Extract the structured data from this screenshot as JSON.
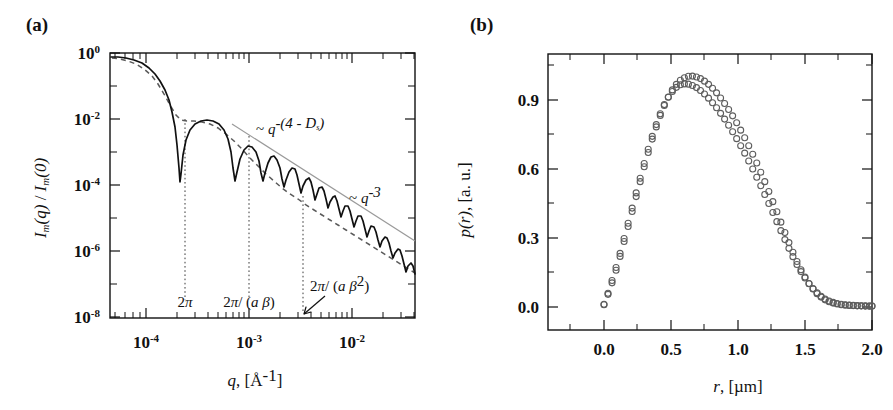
{
  "figure": {
    "panels": [
      {
        "id": "a",
        "label": "(a)",
        "xlabel_parts": {
          "sym": "q",
          "unit": ", [Å",
          "exp": "-1",
          "close": "]"
        },
        "ylabel": "Im(q) / Im(0)"
      },
      {
        "id": "b",
        "label": "(b)",
        "xlabel": "r, [µm]",
        "ylabel": "p(r), [a. u.]"
      }
    ]
  },
  "chart_data": [
    {
      "type": "line",
      "panel": "a",
      "title": "",
      "xlabel": "q, [Å^-1]",
      "ylabel": "I_m(q) / I_m(0)",
      "xscale": "log",
      "yscale": "log",
      "xlim": [
        5e-05,
        0.05
      ],
      "ylim": [
        1e-08,
        1.3
      ],
      "xticks": [
        0.0001,
        0.001,
        0.01
      ],
      "xticklabels": [
        "10",
        "10",
        "10"
      ],
      "xtick_exponents": [
        "-4",
        "-3",
        "-2"
      ],
      "yticks": [
        1.0,
        0.01,
        0.0001,
        1e-06,
        1e-08
      ],
      "yticklabels": [
        "10",
        "10",
        "10",
        "10",
        "10"
      ],
      "ytick_exponents": [
        "0",
        "-2",
        "-4",
        "-6",
        "-8"
      ],
      "grid": false,
      "legend": "none",
      "series": [
        {
          "name": "model scattering intensity (solid)",
          "style": "solid",
          "color": "#111111",
          "description": "oscillatory form factor with deep minima decaying as power law"
        },
        {
          "name": "envelope / smooth fit (dashed)",
          "style": "dashed",
          "color": "#5a5a5a",
          "description": "smoothed envelope following q^-(4-Ds)"
        },
        {
          "name": "q^-3 guide line (thin grey)",
          "style": "thin-solid",
          "color": "#9a9a9a",
          "description": "asymptotic power law guide"
        }
      ],
      "annotations": [
        {
          "text": "~ q",
          "sup": "-(4 - Ds)",
          "x": 0.0013,
          "y": 0.02,
          "name": "power-law-4-minus-ds"
        },
        {
          "text": "~ q",
          "sup": "-3",
          "x": 0.009,
          "y": 0.0006,
          "name": "power-law-minus-3"
        },
        {
          "text": "2π",
          "x": 0.00031,
          "y": 4e-08,
          "name": "marker-2pi"
        },
        {
          "text": "2π/ (a β)",
          "x": 0.001,
          "y": 4e-08,
          "name": "marker-2pi-over-a-beta"
        },
        {
          "text": "2π/ (a β",
          "sup": "2",
          "close": ")",
          "x": 0.003,
          "y": 2e-07,
          "name": "marker-2pi-over-a-beta-squared"
        }
      ],
      "vertical_markers": [
        {
          "x": 0.00031,
          "label": "2π"
        },
        {
          "x": 0.001,
          "label": "2π/ (a β)"
        },
        {
          "x": 0.003,
          "label": "2π/ (a β^2)"
        }
      ]
    },
    {
      "type": "scatter",
      "panel": "b",
      "title": "",
      "xlabel": "r, [µm]",
      "ylabel": "p(r), [a. u.]",
      "xscale": "linear",
      "yscale": "linear",
      "xlim": [
        -0.17,
        2.18
      ],
      "ylim": [
        -0.09,
        1.12
      ],
      "xticks": [
        0.0,
        0.5,
        1.0,
        1.5,
        2.0
      ],
      "xticklabels": [
        "0.0",
        "0.5",
        "1.0",
        "1.5",
        "2.0"
      ],
      "yticks": [
        0.0,
        0.3,
        0.6,
        0.9
      ],
      "yticklabels": [
        "0.0",
        "0.3",
        "0.6",
        "0.9"
      ],
      "grid": false,
      "legend": "none",
      "marker": "open-circle",
      "marker_color": "#5d5d5d",
      "series": [
        {
          "name": "p(r) distribution A",
          "x": [
            0.0,
            0.03,
            0.06,
            0.09,
            0.12,
            0.15,
            0.18,
            0.21,
            0.24,
            0.27,
            0.3,
            0.33,
            0.36,
            0.39,
            0.42,
            0.45,
            0.48,
            0.51,
            0.54,
            0.57,
            0.6,
            0.63,
            0.66,
            0.69,
            0.72,
            0.75,
            0.78,
            0.81,
            0.84,
            0.87,
            0.9,
            0.93,
            0.96,
            0.99,
            1.02,
            1.05,
            1.08,
            1.11,
            1.14,
            1.17,
            1.2,
            1.23,
            1.26,
            1.29,
            1.32,
            1.35,
            1.38,
            1.41,
            1.44,
            1.47,
            1.5,
            1.53,
            1.56,
            1.59,
            1.62,
            1.65,
            1.68,
            1.71,
            1.74,
            1.77,
            1.8,
            1.83,
            1.86,
            1.89,
            1.92,
            1.95,
            1.98,
            2.0
          ],
          "y": [
            0.01,
            0.055,
            0.105,
            0.16,
            0.22,
            0.285,
            0.35,
            0.415,
            0.48,
            0.545,
            0.61,
            0.672,
            0.73,
            0.783,
            0.833,
            0.876,
            0.913,
            0.944,
            0.968,
            0.986,
            0.997,
            1.003,
            1.004,
            1.0,
            0.993,
            0.982,
            0.968,
            0.951,
            0.931,
            0.909,
            0.885,
            0.859,
            0.831,
            0.801,
            0.769,
            0.736,
            0.701,
            0.664,
            0.626,
            0.586,
            0.545,
            0.502,
            0.458,
            0.414,
            0.369,
            0.324,
            0.28,
            0.238,
            0.198,
            0.162,
            0.13,
            0.102,
            0.078,
            0.058,
            0.043,
            0.031,
            0.023,
            0.017,
            0.013,
            0.01,
            0.008,
            0.007,
            0.006,
            0.005,
            0.005,
            0.004,
            0.004,
            0.004
          ]
        },
        {
          "name": "p(r) distribution B",
          "x": [
            0.0,
            0.03,
            0.06,
            0.09,
            0.12,
            0.15,
            0.18,
            0.21,
            0.24,
            0.27,
            0.3,
            0.33,
            0.36,
            0.39,
            0.42,
            0.45,
            0.48,
            0.51,
            0.54,
            0.57,
            0.6,
            0.63,
            0.66,
            0.69,
            0.72,
            0.75,
            0.78,
            0.81,
            0.84,
            0.87,
            0.9,
            0.93,
            0.96,
            0.99,
            1.02,
            1.05,
            1.08,
            1.11,
            1.14,
            1.17,
            1.2,
            1.23,
            1.26,
            1.29,
            1.32,
            1.35,
            1.38,
            1.41,
            1.44,
            1.47,
            1.5,
            1.53,
            1.56,
            1.59,
            1.62,
            1.65,
            1.68,
            1.71,
            1.74,
            1.77,
            1.8,
            1.83,
            1.86,
            1.89,
            1.92,
            1.95,
            1.98,
            2.0
          ],
          "y": [
            0.012,
            0.06,
            0.115,
            0.172,
            0.233,
            0.298,
            0.364,
            0.43,
            0.496,
            0.56,
            0.624,
            0.686,
            0.742,
            0.793,
            0.84,
            0.88,
            0.912,
            0.937,
            0.955,
            0.966,
            0.97,
            0.969,
            0.963,
            0.954,
            0.941,
            0.926,
            0.908,
            0.888,
            0.866,
            0.842,
            0.817,
            0.79,
            0.762,
            0.732,
            0.701,
            0.669,
            0.635,
            0.6,
            0.564,
            0.527,
            0.489,
            0.45,
            0.411,
            0.371,
            0.332,
            0.293,
            0.255,
            0.219,
            0.185,
            0.154,
            0.126,
            0.101,
            0.08,
            0.062,
            0.047,
            0.035,
            0.026,
            0.02,
            0.015,
            0.012,
            0.01,
            0.008,
            0.007,
            0.006,
            0.005,
            0.005,
            0.004,
            0.004
          ]
        }
      ]
    }
  ]
}
